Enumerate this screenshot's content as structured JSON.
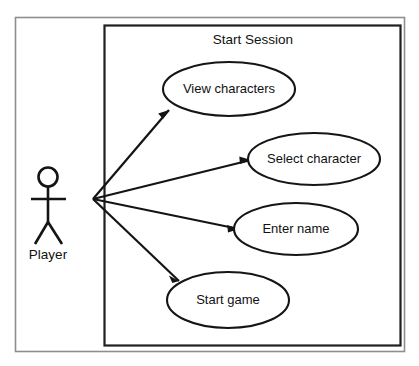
{
  "diagram": {
    "kind": "uml-use-case-diagram",
    "system": {
      "title": "Start Session"
    },
    "actors": [
      {
        "id": "player",
        "label": "Player",
        "x": 48,
        "y": 200
      }
    ],
    "use_cases": [
      {
        "id": "view-characters",
        "label": "View characters",
        "cx": 229,
        "cy": 89,
        "rx": 66,
        "ry": 27
      },
      {
        "id": "select-character",
        "label": "Select character",
        "cx": 314,
        "cy": 159,
        "rx": 66,
        "ry": 26
      },
      {
        "id": "enter-name",
        "label": "Enter name",
        "cx": 296,
        "cy": 229,
        "rx": 62,
        "ry": 26
      },
      {
        "id": "start-game",
        "label": "Start game",
        "cx": 228,
        "cy": 300,
        "rx": 61,
        "ry": 28
      }
    ],
    "associations": [
      {
        "id": "player-to-view-characters",
        "from": "player",
        "to": "view-characters"
      },
      {
        "id": "player-to-select-character",
        "from": "player",
        "to": "select-character"
      },
      {
        "id": "player-to-enter-name",
        "from": "player",
        "to": "enter-name"
      },
      {
        "id": "player-to-start-game",
        "from": "player",
        "to": "start-game"
      }
    ],
    "colors": {
      "stroke": "#141414",
      "frame": "#8e8e8e",
      "background": "#ffffff"
    }
  }
}
